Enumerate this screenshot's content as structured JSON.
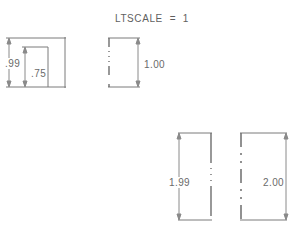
{
  "title": "LTSCALE  =  1",
  "colors": {
    "background": "#ffffff",
    "line": "#7a7a7a",
    "dashed_line": "#6e6e6e",
    "text": "#6a6a6a",
    "dimension_line": "#8a8a8a"
  },
  "figures": [
    {
      "id": "figure-top-left",
      "dimensions": [
        {
          "name": "dim-099",
          "label": ".99",
          "value": 0.99
        },
        {
          "name": "dim-075",
          "label": ".75",
          "value": 0.75
        }
      ],
      "linetype": "continuous"
    },
    {
      "id": "figure-top-right",
      "dimensions": [
        {
          "name": "dim-100",
          "label": "1.00",
          "value": 1.0
        }
      ],
      "linetype": "dotted"
    },
    {
      "id": "figure-bottom-left",
      "dimensions": [
        {
          "name": "dim-199",
          "label": "1.99",
          "value": 1.99
        }
      ],
      "linetype": "dotted"
    },
    {
      "id": "figure-bottom-right",
      "dimensions": [
        {
          "name": "dim-200",
          "label": "2.00",
          "value": 2.0
        }
      ],
      "linetype": "dashed"
    }
  ]
}
